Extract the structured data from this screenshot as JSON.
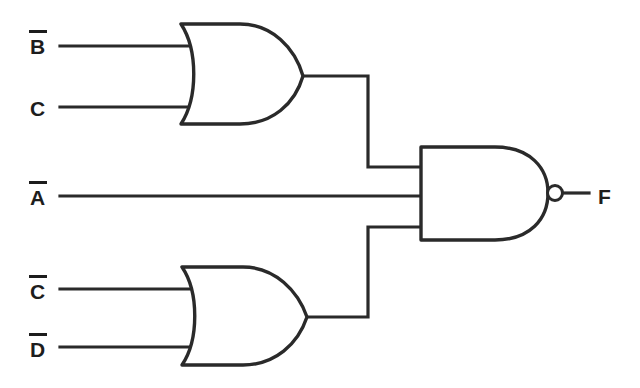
{
  "diagram": {
    "background_color": "#ffffff",
    "line_color": "#2a2a2a",
    "text_color": "#1d1d1d"
  },
  "inputs": [
    {
      "id": "in-b-not",
      "label": "B",
      "negated": true,
      "x": 30,
      "y": 33
    },
    {
      "id": "in-c",
      "label": "C",
      "negated": false,
      "x": 30,
      "y": 95
    },
    {
      "id": "in-a-not",
      "label": "A",
      "negated": true,
      "x": 30,
      "y": 184
    },
    {
      "id": "in-c-not",
      "label": "C",
      "negated": true,
      "x": 30,
      "y": 278
    },
    {
      "id": "in-d-not",
      "label": "D",
      "negated": true,
      "x": 30,
      "y": 336
    }
  ],
  "outputs": [
    {
      "id": "out-f",
      "label": "F",
      "negated": false,
      "x": 598,
      "y": 183
    }
  ],
  "gates": [
    {
      "id": "or-gate-top",
      "type": "OR",
      "inputs": [
        "B-not",
        "C"
      ],
      "output": "n1"
    },
    {
      "id": "or-gate-bottom",
      "type": "OR",
      "inputs": [
        "C-not",
        "D-not"
      ],
      "output": "n2"
    },
    {
      "id": "nand-gate",
      "type": "NAND",
      "inputs": [
        "n1",
        "A-not",
        "n2"
      ],
      "output": "F"
    }
  ]
}
